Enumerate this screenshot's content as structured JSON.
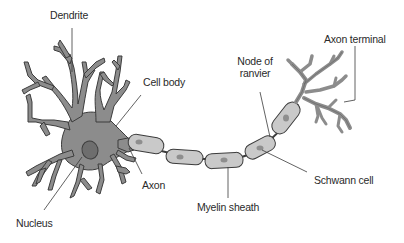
{
  "diagram": {
    "labels": {
      "dendrite": "Dendrite",
      "cell_body": "Cell body",
      "node_of_ranvier_line1": "Node of",
      "node_of_ranvier_line2": "ranvier",
      "axon_terminal": "Axon terminal",
      "axon": "Axon",
      "nucleus": "Nucleus",
      "myelin_sheath": "Myelin sheath",
      "schwann_cell": "Schwann cell"
    },
    "colors": {
      "cell_fill": "#8c8c8c",
      "cell_outline": "#3c3c3c",
      "myelin_fill": "#c9c9c9",
      "nucleus_fill": "#6e6e6e",
      "leader_line": "#3a3a3a",
      "text": "#2a2a2a",
      "background": "#ffffff"
    }
  }
}
